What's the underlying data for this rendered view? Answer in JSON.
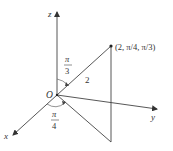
{
  "diagram": {
    "type": "spherical-coordinates",
    "axes": {
      "x": "x",
      "y": "y",
      "z": "z"
    },
    "origin_label": "O",
    "point_label": "(2, π/4, π/3)",
    "rho_label": "2",
    "phi_label": {
      "numerator": "π",
      "denominator": "3"
    },
    "theta_label": {
      "numerator": "π",
      "denominator": "4"
    },
    "colors": {
      "line": "#444444",
      "text": "#333333",
      "background": "#ffffff"
    }
  }
}
